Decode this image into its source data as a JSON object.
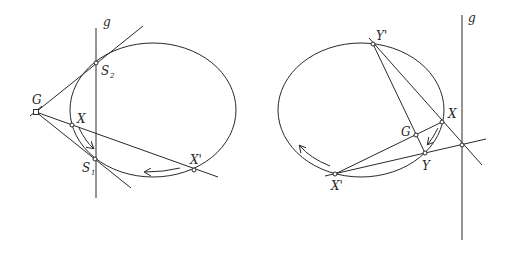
{
  "figures": [
    {
      "name": "left-figure",
      "labels": {
        "g": "g",
        "G": "G",
        "S2": "S",
        "S2_sub": "2",
        "S1": "S",
        "S1_sub": "1",
        "X": "X",
        "Xp": "X'"
      }
    },
    {
      "name": "right-figure",
      "labels": {
        "g": "g",
        "Yp": "Y'",
        "X": "X",
        "G": "G",
        "Y": "Y",
        "Xp": "X'"
      }
    }
  ],
  "colors": {
    "stroke": "#2a2a2a",
    "background": "#ffffff"
  }
}
